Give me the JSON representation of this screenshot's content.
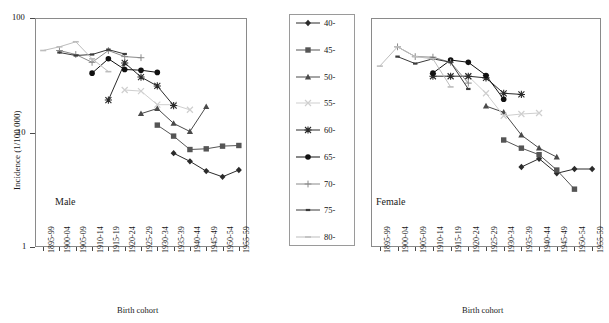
{
  "figure": {
    "y_axis_title": "Incidence (1/100 000)",
    "x_axis_title_left": "Birth cohort",
    "x_axis_title_right": "Birth cohort",
    "panel_label_left": "Male",
    "panel_label_right": "Female",
    "y_ticks": [
      "100",
      "10",
      "1"
    ],
    "caption": ""
  },
  "legend": {
    "position": "center-between-panels",
    "entries": [
      {
        "label": "40-",
        "marker": "diamond",
        "color": "#2b2b2b"
      },
      {
        "label": "45-",
        "marker": "square",
        "color": "#555555"
      },
      {
        "label": "50-",
        "marker": "triangle",
        "color": "#4a4a4a"
      },
      {
        "label": "55-",
        "marker": "cross-x",
        "color": "#cfcfcf"
      },
      {
        "label": "60-",
        "marker": "asterisk",
        "color": "#2b2b2b"
      },
      {
        "label": "65-",
        "marker": "circle",
        "color": "#111111"
      },
      {
        "label": "70-",
        "marker": "plus",
        "color": "#8a8a8a"
      },
      {
        "label": "75-",
        "marker": "dash",
        "color": "#3a3a3a"
      },
      {
        "label": "80-",
        "marker": "line",
        "color": "#bdbdbd"
      }
    ]
  },
  "chart_data": {
    "type": "line",
    "title": "",
    "xlabel": "Birth cohort",
    "ylabel": "Incidence (1/100 000)",
    "yscale": "log",
    "ylim": [
      1,
      100
    ],
    "yticks": [
      1,
      10,
      100
    ],
    "grid": false,
    "legend_title": "Age group (years)",
    "categories": [
      "1895-99",
      "1900-04",
      "1905-09",
      "1910-14",
      "1915-19",
      "1920-24",
      "1925-29",
      "1930-34",
      "1935-39",
      "1940-44",
      "1945-49",
      "1950-54",
      "1955-59"
    ],
    "panels": [
      {
        "name": "Male",
        "series": [
          {
            "name": "40-",
            "marker": "diamond",
            "color": "#2b2b2b",
            "x": [
              "1935-39",
              "1940-44",
              "1945-49",
              "1950-54",
              "1955-59"
            ],
            "values": [
              6.6,
              5.6,
              4.6,
              4.1,
              4.7
            ]
          },
          {
            "name": "45-",
            "marker": "square",
            "color": "#555555",
            "x": [
              "1930-34",
              "1935-39",
              "1940-44",
              "1945-49",
              "1950-54",
              "1955-59"
            ],
            "values": [
              11.6,
              9.3,
              7.1,
              7.2,
              7.6,
              7.7
            ]
          },
          {
            "name": "50-",
            "marker": "triangle",
            "color": "#4a4a4a",
            "x": [
              "1925-29",
              "1930-34",
              "1935-39",
              "1940-44",
              "1945-49"
            ],
            "values": [
              14.6,
              16.2,
              12.0,
              10.2,
              16.8
            ]
          },
          {
            "name": "55-",
            "marker": "cross-x",
            "color": "#cfcfcf",
            "x": [
              "1920-24",
              "1925-29",
              "1930-34",
              "1935-39",
              "1940-44"
            ],
            "values": [
              23.5,
              23.0,
              17.5,
              17.5,
              15.8
            ]
          },
          {
            "name": "60-",
            "marker": "asterisk",
            "color": "#2b2b2b",
            "x": [
              "1915-19",
              "1920-24",
              "1925-29",
              "1930-34",
              "1935-39"
            ],
            "values": [
              19.2,
              40.5,
              30.5,
              25.5,
              17.2
            ]
          },
          {
            "name": "65-",
            "marker": "circle",
            "color": "#111111",
            "x": [
              "1910-14",
              "1915-19",
              "1920-24",
              "1925-29",
              "1930-34"
            ],
            "values": [
              33.0,
              44.0,
              35.5,
              35.0,
              33.5
            ]
          },
          {
            "name": "70-",
            "marker": "plus",
            "color": "#8a8a8a",
            "x": [
              "1900-04",
              "1905-09",
              "1910-14",
              "1915-19",
              "1920-24",
              "1925-29"
            ],
            "values": [
              52.0,
              48.0,
              41.0,
              52.0,
              46.0,
              45.0
            ]
          },
          {
            "name": "75-",
            "marker": "dash",
            "color": "#3a3a3a",
            "x": [
              "1900-04",
              "1905-09",
              "1910-14",
              "1915-19",
              "1920-24"
            ],
            "values": [
              50.0,
              47.0,
              48.0,
              53.0,
              48.5
            ]
          },
          {
            "name": "80-",
            "marker": "line",
            "color": "#bdbdbd",
            "x": [
              "1895-99",
              "1900-04",
              "1905-09",
              "1910-14",
              "1915-19"
            ],
            "values": [
              52.0,
              56.0,
              62.0,
              44.0,
              34.0
            ]
          }
        ]
      },
      {
        "name": "Female",
        "series": [
          {
            "name": "40-",
            "marker": "diamond",
            "color": "#2b2b2b",
            "x": [
              "1935-39",
              "1940-44",
              "1945-49",
              "1950-54",
              "1955-59"
            ],
            "values": [
              5.0,
              5.9,
              4.4,
              4.8,
              4.8
            ]
          },
          {
            "name": "45-",
            "marker": "square",
            "color": "#555555",
            "x": [
              "1930-34",
              "1935-39",
              "1940-44",
              "1945-49",
              "1950-54"
            ],
            "values": [
              8.6,
              7.3,
              6.4,
              4.7,
              3.2
            ]
          },
          {
            "name": "50-",
            "marker": "triangle",
            "color": "#4a4a4a",
            "x": [
              "1925-29",
              "1930-34",
              "1935-39",
              "1940-44",
              "1945-49"
            ],
            "values": [
              17.0,
              15.0,
              9.5,
              7.3,
              6.1
            ]
          },
          {
            "name": "55-",
            "marker": "cross-x",
            "color": "#cfcfcf",
            "x": [
              "1920-24",
              "1925-29",
              "1930-34",
              "1935-39",
              "1940-44"
            ],
            "values": [
              31.0,
              22.0,
              14.0,
              14.5,
              14.8
            ]
          },
          {
            "name": "60-",
            "marker": "asterisk",
            "color": "#2b2b2b",
            "x": [
              "1910-14",
              "1915-19",
              "1920-24",
              "1925-29",
              "1930-34",
              "1935-39"
            ],
            "values": [
              31.0,
              31.0,
              31.0,
              30.0,
              22.0,
              21.5
            ]
          },
          {
            "name": "65-",
            "marker": "circle",
            "color": "#111111",
            "x": [
              "1910-14",
              "1915-19",
              "1920-24",
              "1925-29",
              "1930-34"
            ],
            "values": [
              33.0,
              43.0,
              41.0,
              31.5,
              19.5
            ]
          },
          {
            "name": "70-",
            "marker": "plus",
            "color": "#8a8a8a",
            "x": [
              "1900-04",
              "1905-09",
              "1910-14",
              "1915-19",
              "1920-24"
            ],
            "values": [
              56.0,
              46.0,
              45.5,
              41.0,
              27.0
            ]
          },
          {
            "name": "75-",
            "marker": "dash",
            "color": "#3a3a3a",
            "x": [
              "1900-04",
              "1905-09",
              "1910-14",
              "1915-19",
              "1920-24"
            ],
            "values": [
              46.0,
              40.0,
              44.0,
              41.0,
              24.0
            ]
          },
          {
            "name": "80-",
            "marker": "line",
            "color": "#bdbdbd",
            "x": [
              "1895-99",
              "1900-04",
              "1905-09",
              "1910-14",
              "1915-19"
            ],
            "values": [
              38.0,
              56.0,
              46.0,
              44.0,
              25.0
            ]
          }
        ]
      }
    ]
  }
}
